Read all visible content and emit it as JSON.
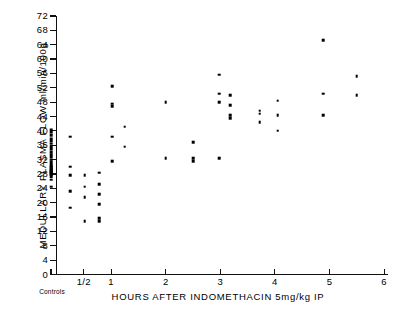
{
  "chart_data": {
    "type": "scatter",
    "title": "",
    "xlabel": "HOURS  AFTER  INDOMETHACIN  5mg/kg  IP",
    "ylabel": "MEDULLARY PLASMA FLOW  ml/min/100g",
    "xlim": [
      -0.2,
      6
    ],
    "ylim": [
      0,
      72
    ],
    "ytick_values": [
      0,
      4,
      8,
      12,
      16,
      20,
      24,
      28,
      32,
      36,
      40,
      44,
      48,
      52,
      56,
      60,
      64,
      68,
      72
    ],
    "ytick_labels": [
      "0",
      "4",
      "8",
      "12",
      "16",
      "20",
      "24",
      "28",
      "32",
      "36",
      "40",
      "44",
      "48",
      "52",
      "56",
      "60",
      "64",
      "68",
      "72"
    ],
    "xtick_values": [
      0.5,
      1,
      2,
      3,
      4,
      5,
      6
    ],
    "xtick_labels": [
      "1/2",
      "1",
      "2",
      "3",
      "4",
      "5",
      "6"
    ],
    "control_group_label": "Controls",
    "control_x": -0.1,
    "grid": false,
    "legend": false,
    "marker": "square-dot",
    "marker_color": "#000000",
    "series": [
      {
        "name": "Controls",
        "x_label": "Controls",
        "points": [
          {
            "x": -0.1,
            "y": 40.0
          },
          {
            "x": -0.1,
            "y": 38.8
          },
          {
            "x": -0.1,
            "y": 37.6
          },
          {
            "x": -0.1,
            "y": 36.4
          },
          {
            "x": -0.1,
            "y": 35.2
          },
          {
            "x": -0.1,
            "y": 34.0
          },
          {
            "x": -0.1,
            "y": 33.0
          },
          {
            "x": -0.1,
            "y": 32.0
          },
          {
            "x": -0.1,
            "y": 31.0
          },
          {
            "x": -0.1,
            "y": 30.2
          },
          {
            "x": -0.1,
            "y": 29.2
          },
          {
            "x": -0.1,
            "y": 28.6
          },
          {
            "x": -0.1,
            "y": 28.0
          },
          {
            "x": -0.1,
            "y": 26.4
          },
          {
            "x": -0.1,
            "y": 24.4
          }
        ]
      },
      {
        "name": "0.25 hours",
        "points": [
          {
            "x": 0.25,
            "y": 38.4
          },
          {
            "x": 0.25,
            "y": 30.0
          },
          {
            "x": 0.25,
            "y": 27.6
          },
          {
            "x": 0.25,
            "y": 23.2
          },
          {
            "x": 0.25,
            "y": 18.6
          }
        ]
      },
      {
        "name": "0.5 hours",
        "points": [
          {
            "x": 0.52,
            "y": 27.6
          },
          {
            "x": 0.52,
            "y": 24.4
          },
          {
            "x": 0.52,
            "y": 21.6
          },
          {
            "x": 0.52,
            "y": 14.8
          }
        ]
      },
      {
        "name": "0.75 hours",
        "points": [
          {
            "x": 0.78,
            "y": 28.4
          },
          {
            "x": 0.78,
            "y": 25.2
          },
          {
            "x": 0.78,
            "y": 22.4
          },
          {
            "x": 0.78,
            "y": 19.6
          },
          {
            "x": 0.78,
            "y": 15.6
          },
          {
            "x": 0.78,
            "y": 14.8
          }
        ]
      },
      {
        "name": "1 hour",
        "points": [
          {
            "x": 1.02,
            "y": 52.4
          },
          {
            "x": 1.02,
            "y": 47.6
          },
          {
            "x": 1.02,
            "y": 46.8
          },
          {
            "x": 1.02,
            "y": 38.4
          },
          {
            "x": 1.02,
            "y": 31.6
          }
        ]
      },
      {
        "name": "1.25 hours",
        "points": [
          {
            "x": 1.25,
            "y": 41.2
          },
          {
            "x": 1.25,
            "y": 35.6
          }
        ]
      },
      {
        "name": "2 hours",
        "points": [
          {
            "x": 2.0,
            "y": 48.0
          },
          {
            "x": 2.0,
            "y": 32.4
          }
        ]
      },
      {
        "name": "2.5 hours",
        "points": [
          {
            "x": 2.5,
            "y": 36.8
          },
          {
            "x": 2.5,
            "y": 32.4
          },
          {
            "x": 2.5,
            "y": 31.6
          }
        ]
      },
      {
        "name": "3 hours",
        "points": [
          {
            "x": 2.98,
            "y": 55.6
          },
          {
            "x": 2.98,
            "y": 50.4
          },
          {
            "x": 2.98,
            "y": 48.0
          },
          {
            "x": 2.98,
            "y": 32.4
          }
        ]
      },
      {
        "name": "3.2 hours",
        "points": [
          {
            "x": 3.18,
            "y": 50.0
          },
          {
            "x": 3.18,
            "y": 47.2
          },
          {
            "x": 3.18,
            "y": 44.4
          },
          {
            "x": 3.18,
            "y": 43.6
          }
        ]
      },
      {
        "name": "3.7 hours",
        "points": [
          {
            "x": 3.72,
            "y": 45.6
          },
          {
            "x": 3.72,
            "y": 44.8
          },
          {
            "x": 3.72,
            "y": 42.4
          }
        ]
      },
      {
        "name": "4 hours",
        "points": [
          {
            "x": 4.05,
            "y": 48.4
          },
          {
            "x": 4.05,
            "y": 44.4
          },
          {
            "x": 4.05,
            "y": 40.0
          }
        ]
      },
      {
        "name": "4.9 hours",
        "points": [
          {
            "x": 4.88,
            "y": 65.2
          },
          {
            "x": 4.88,
            "y": 50.4
          },
          {
            "x": 4.88,
            "y": 44.4
          }
        ]
      },
      {
        "name": "5.5 hours",
        "points": [
          {
            "x": 5.5,
            "y": 55.2
          },
          {
            "x": 5.5,
            "y": 50.0
          }
        ]
      }
    ]
  },
  "axes": {
    "y": {
      "label": "MEDULLARY PLASMA FLOW  ml/min/100g",
      "ticks": [
        "72",
        "68",
        "64",
        "60",
        "56",
        "52",
        "48",
        "44",
        "40",
        "36",
        "32",
        "28",
        "24",
        "20",
        "16",
        "12",
        "8",
        "4",
        "0"
      ]
    },
    "x": {
      "label": "HOURS  AFTER  INDOMETHACIN  5mg/kg  IP",
      "ticks": [
        "1/2",
        "1",
        "2",
        "3",
        "4",
        "5",
        "6"
      ],
      "control_label": "Controls"
    }
  }
}
